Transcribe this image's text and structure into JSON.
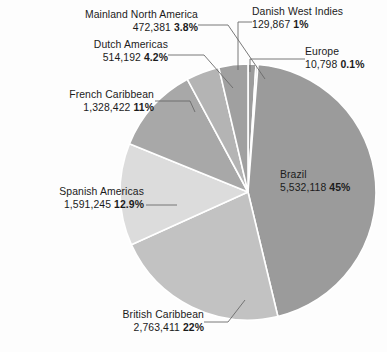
{
  "chart_data": {
    "type": "pie",
    "title": "",
    "subtitle": "",
    "xlabel": "",
    "ylabel": "",
    "legend_position": "none",
    "grid": false,
    "label_format": "name, value with thousands separators, percent",
    "start_angle_deg": 0,
    "direction": "clockwise",
    "categories": [
      "Danish West Indies",
      "Europe",
      "Brazil",
      "British Caribbean",
      "Spanish Americas",
      "French Caribbean",
      "Dutch Americas",
      "Mainland North America"
    ],
    "values": [
      129867,
      10798,
      5532118,
      2763411,
      1591245,
      1328422,
      514192,
      472381
    ],
    "percents": [
      1,
      0.1,
      45,
      22,
      12.9,
      11,
      4.2,
      3.8
    ],
    "slices": [
      {
        "name": "Danish West Indies",
        "value": 129867,
        "value_label": "129,867",
        "percent": 1,
        "percent_label": "1%",
        "color": "#9d9d9d",
        "start_deg": 0,
        "end_deg": 3.6
      },
      {
        "name": "Europe",
        "value": 10798,
        "value_label": "10,798",
        "percent": 0.1,
        "percent_label": "0.1%",
        "color": "#a5a5a5",
        "start_deg": 3.6,
        "end_deg": 4.5
      },
      {
        "name": "Brazil",
        "value": 5532118,
        "value_label": "5,532,118",
        "percent": 45,
        "percent_label": "45%",
        "color": "#9b9b9b",
        "start_deg": 4.5,
        "end_deg": 166.5
      },
      {
        "name": "British Caribbean",
        "value": 2763411,
        "value_label": "2,763,411",
        "percent": 22,
        "percent_label": "22%",
        "color": "#c2c2c2",
        "start_deg": 166.5,
        "end_deg": 245.7
      },
      {
        "name": "Spanish Americas",
        "value": 1591245,
        "value_label": "1,591,245",
        "percent": 12.9,
        "percent_label": "12.9%",
        "color": "#dcdcdc",
        "start_deg": 245.7,
        "end_deg": 292.1
      },
      {
        "name": "French Caribbean",
        "value": 1328422,
        "value_label": "1,328,422",
        "percent": 11,
        "percent_label": "11%",
        "color": "#a8a8a8",
        "start_deg": 292.1,
        "end_deg": 331.7
      },
      {
        "name": "Dutch Americas",
        "value": 514192,
        "value_label": "514,192",
        "percent": 4.2,
        "percent_label": "4.2%",
        "color": "#b4b4b4",
        "start_deg": 331.7,
        "end_deg": 346.8
      },
      {
        "name": "Mainland North America",
        "value": 472381,
        "value_label": "472,381",
        "percent": 3.8,
        "percent_label": "3.8%",
        "color": "#a0a0a0",
        "start_deg": 346.8,
        "end_deg": 360
      }
    ]
  },
  "labels": {
    "mainland_north_america": {
      "name": "Mainland North America",
      "value": "472,381",
      "percent": "3.8%"
    },
    "dutch_americas": {
      "name": "Dutch Americas",
      "value": "514,192",
      "percent": "4.2%"
    },
    "french_caribbean": {
      "name": "French Caribbean",
      "value": "1,328,422",
      "percent": "11%"
    },
    "spanish_americas": {
      "name": "Spanish Americas",
      "value": "1,591,245",
      "percent": "12.9%"
    },
    "british_caribbean": {
      "name": "British Caribbean",
      "value": "2,763,411",
      "percent": "22%"
    },
    "danish_west_indies": {
      "name": "Danish West Indies",
      "value": "129,867",
      "percent": "1%"
    },
    "europe": {
      "name": "Europe",
      "value": "10,798",
      "percent": "0.1%"
    },
    "brazil": {
      "name": "Brazil",
      "value": "5,532,118",
      "percent": "45%"
    }
  },
  "colors": {
    "background": "#fdfdfd",
    "text": "#1b1b1b",
    "leader_line": "#6a6a6a",
    "slice_separator": "#ffffff"
  }
}
